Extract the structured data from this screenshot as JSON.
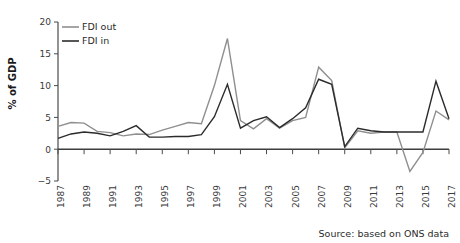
{
  "chart_data": {
    "type": "line",
    "title": "",
    "xlabel": "",
    "ylabel": "% of GDP",
    "xlim": [
      1987,
      2017
    ],
    "ylim": [
      -5,
      20
    ],
    "yticks": [
      -5,
      0,
      5,
      10,
      15,
      20
    ],
    "ytick_labels": [
      "−5",
      "0",
      "5",
      "10",
      "15",
      "20"
    ],
    "xticks": [
      1987,
      1989,
      1991,
      1993,
      1995,
      1997,
      1999,
      2001,
      2003,
      2005,
      2007,
      2009,
      2011,
      2013,
      2015,
      2017
    ],
    "xtick_labels": [
      "1987",
      "1989",
      "1991",
      "1993",
      "1995",
      "1997",
      "1999",
      "2001",
      "2003",
      "2005",
      "2007",
      "2009",
      "2011",
      "2013",
      "2015",
      "2017"
    ],
    "grid": false,
    "legend_position": "top-left",
    "x": [
      1987,
      1988,
      1989,
      1990,
      1991,
      1992,
      1993,
      1994,
      1995,
      1996,
      1997,
      1998,
      1999,
      2000,
      2001,
      2002,
      2003,
      2004,
      2005,
      2006,
      2007,
      2008,
      2009,
      2010,
      2011,
      2012,
      2013,
      2014,
      2015,
      2016,
      2017
    ],
    "series": [
      {
        "name": "FDI out",
        "color": "#8f8f8f",
        "values": [
          3.6,
          4.2,
          4.1,
          2.8,
          2.6,
          2.1,
          2.4,
          2.3,
          3.0,
          3.6,
          4.2,
          4.0,
          10.0,
          17.4,
          4.5,
          3.2,
          4.8,
          3.3,
          4.5,
          5.0,
          12.9,
          10.8,
          0.2,
          2.9,
          2.5,
          2.7,
          2.7,
          -3.5,
          -0.5,
          6.0,
          4.6
        ]
      },
      {
        "name": "FDI in",
        "color": "#2b2b2b",
        "values": [
          1.7,
          2.4,
          2.7,
          2.5,
          2.1,
          2.8,
          3.7,
          1.9,
          1.9,
          2.0,
          2.0,
          2.3,
          5.1,
          10.2,
          3.3,
          4.5,
          5.1,
          3.4,
          4.8,
          6.5,
          11.0,
          10.2,
          0.4,
          3.3,
          2.9,
          2.7,
          2.7,
          2.7,
          2.7,
          10.7,
          4.8
        ]
      }
    ]
  },
  "annotations": {
    "source": "Source: based on ONS data"
  }
}
